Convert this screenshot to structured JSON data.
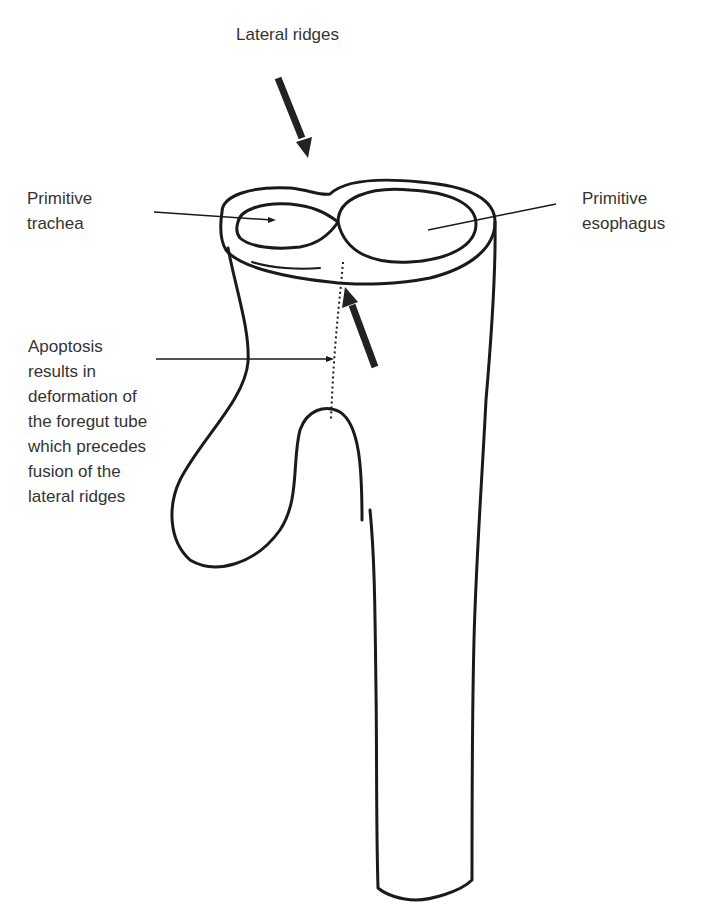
{
  "diagram": {
    "type": "anatomical-illustration",
    "labels": {
      "lateral_ridges": "Lateral ridges",
      "trachea": "Primitive\ntrachea",
      "esophagus": "Primitive\nesophagus",
      "apoptosis": "Apoptosis\nresults in\ndeformation of\nthe foregut tube\nwhich precedes\nfusion of the\nlateral ridges"
    },
    "arrows": [
      {
        "name": "lateral-ridge-arrow-top",
        "direction": "down-right"
      },
      {
        "name": "lateral-ridge-arrow-bottom",
        "direction": "up-left"
      }
    ],
    "colors": {
      "stroke": "#1a1a1a",
      "text": "#333333",
      "background": "#ffffff"
    }
  }
}
